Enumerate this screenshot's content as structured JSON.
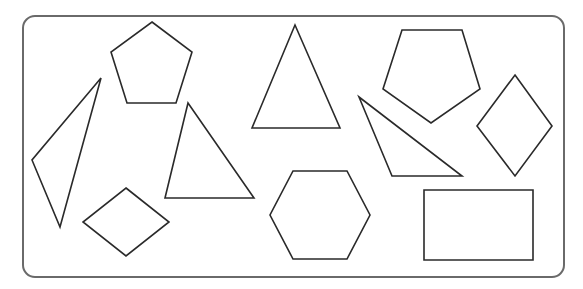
{
  "figure": {
    "stroke_color": "#2a2a2a",
    "frame_color": "#6a6a6a",
    "background": "#ffffff",
    "frame": {
      "x": 23,
      "y": 16,
      "width": 541,
      "height": 261,
      "radius": 12
    },
    "shapes": [
      {
        "id": "pentagon-top-left",
        "type": "pentagon",
        "points": "152,22 192,52 176,103 127,103 111,52"
      },
      {
        "id": "triangle-thin-left",
        "type": "triangle",
        "points": "101,78 60,227 32,160"
      },
      {
        "id": "triangle-center-left",
        "type": "triangle",
        "points": "188,103 254,198 165,198"
      },
      {
        "id": "diamond-bottom-left",
        "type": "rhombus",
        "points": "126,188 169,222 126,256 83,222"
      },
      {
        "id": "triangle-isosceles-top",
        "type": "triangle",
        "points": "295,25 340,128 252,128"
      },
      {
        "id": "hexagon-bottom-center",
        "type": "hexagon",
        "points": "293,171 347,171 370,215 347,259 293,259 270,215"
      },
      {
        "id": "pentagon-top-right",
        "type": "pentagon",
        "points": "402,30 462,30 480,89 431,123 383,89"
      },
      {
        "id": "triangle-obtuse-right",
        "type": "triangle",
        "points": "359,97 462,176 392,176"
      },
      {
        "id": "diamond-right",
        "type": "rhombus",
        "points": "515,75 552,126 515,176 477,126"
      },
      {
        "id": "rectangle-bottom-right",
        "type": "rectangle",
        "points": "424,190 533,190 533,260 424,260"
      }
    ]
  }
}
